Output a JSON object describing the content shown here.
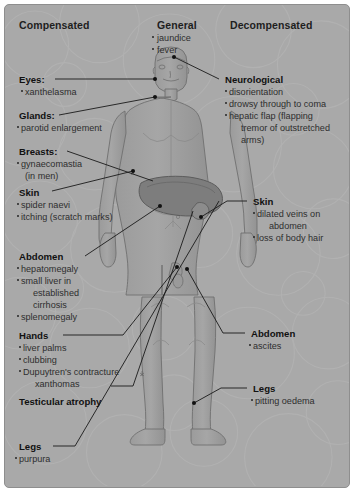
{
  "diagram": {
    "columns": {
      "left_header": "Compensated",
      "center_header": "General",
      "right_header": "Decompensated"
    },
    "colors": {
      "background": "#a9a9a9",
      "body_fill": "#a0a0a0",
      "body_outline": "#6f6f6f",
      "liver": "#7e7e7e",
      "leader_line": "#1a1a1a",
      "text": "#1b1b1b",
      "panel_border": "#8e8e8e"
    },
    "center_general": {
      "title": "General",
      "items": [
        "jaundice",
        "fever"
      ]
    },
    "left_groups": [
      {
        "title": "Eyes:",
        "items": [
          "xanthelasma"
        ],
        "continuations": []
      },
      {
        "title": "Glands:",
        "items": [
          "parotid enlargement"
        ],
        "continuations": []
      },
      {
        "title": "Breasts:",
        "items": [
          "gynaecomastia"
        ],
        "continuations": [
          "(in men)"
        ]
      },
      {
        "title": "Skin",
        "items": [
          "spider naevi",
          "itching (scratch marks)"
        ],
        "continuations": []
      },
      {
        "title": "Abdomen",
        "items": [
          "hepatomegaly",
          "small liver in",
          "splenomegaly"
        ],
        "continuations": [
          "established",
          "cirrhosis"
        ]
      },
      {
        "title": "Hands",
        "items": [
          "liver palms",
          "clubbing",
          "Dupuytren's contracture"
        ],
        "continuations": [
          "xanthomas"
        ]
      },
      {
        "title": "Testicular atrophy",
        "items": [],
        "continuations": []
      },
      {
        "title": "Legs",
        "items": [
          "purpura"
        ],
        "continuations": []
      }
    ],
    "right_groups": [
      {
        "title": "Neurological",
        "items": [
          "disorientation",
          "drowsy through to coma",
          "hepatic flap (flapping"
        ],
        "continuations": [
          "tremor of outstretched",
          "arms)"
        ]
      },
      {
        "title": "Skin",
        "items": [
          "dilated veins on",
          "loss of body hair"
        ],
        "continuations": [
          "abdomen"
        ]
      },
      {
        "title": "Abdomen",
        "items": [
          "ascites"
        ],
        "continuations": []
      },
      {
        "title": "Legs",
        "items": [
          "pitting oedema"
        ],
        "continuations": []
      }
    ],
    "body_figure": {
      "name": "human-body-anterior-view",
      "organ": "liver"
    }
  }
}
